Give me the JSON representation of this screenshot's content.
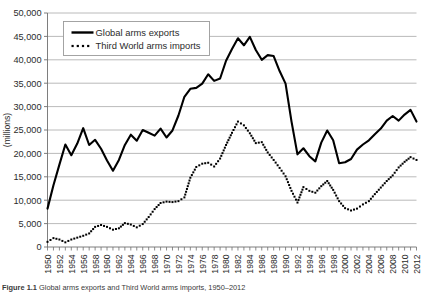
{
  "figure": {
    "caption_label": "Figure 1.1",
    "caption_text": "Global arms exports and Third World arms imports, 1950–2012"
  },
  "axes": {
    "ylabel": "(millions)",
    "yticks": [
      "0",
      "5,000",
      "10,000",
      "15,000",
      "20,000",
      "25,000",
      "30,000",
      "35,000",
      "40,000",
      "45,000",
      "50,000"
    ],
    "xticks": [
      "1950",
      "1952",
      "1954",
      "1956",
      "1958",
      "1960",
      "1962",
      "1964",
      "1966",
      "1968",
      "1970",
      "1972",
      "1974",
      "1976",
      "1978",
      "1980",
      "1982",
      "1984",
      "1986",
      "1988",
      "1990",
      "1992",
      "1994",
      "1996",
      "1998",
      "2000",
      "2002",
      "2004",
      "2006",
      "2008",
      "2010",
      "2012"
    ]
  },
  "legend": {
    "items": [
      {
        "label": "Global arms exports",
        "style": "solid",
        "color": "#000000"
      },
      {
        "label": "Third World arms imports",
        "style": "dotted",
        "color": "#000000"
      }
    ]
  },
  "colors": {
    "line": "#000000",
    "grid": "#a8a8a8",
    "axis": "#8c8c8c",
    "background": "#ffffff"
  },
  "chart_data": {
    "type": "line",
    "title": "",
    "xlabel": "",
    "ylabel": "(millions)",
    "ylim": [
      0,
      50000
    ],
    "xlim": [
      1950,
      2012
    ],
    "grid": true,
    "legend_position": "top-left-inside",
    "x": [
      1950,
      1951,
      1952,
      1953,
      1954,
      1955,
      1956,
      1957,
      1958,
      1959,
      1960,
      1961,
      1962,
      1963,
      1964,
      1965,
      1966,
      1967,
      1968,
      1969,
      1970,
      1971,
      1972,
      1973,
      1974,
      1975,
      1976,
      1977,
      1978,
      1979,
      1980,
      1981,
      1982,
      1983,
      1984,
      1985,
      1986,
      1987,
      1988,
      1989,
      1990,
      1991,
      1992,
      1993,
      1994,
      1995,
      1996,
      1997,
      1998,
      1999,
      2000,
      2001,
      2002,
      2003,
      2004,
      2005,
      2006,
      2007,
      2008,
      2009,
      2010,
      2011,
      2012
    ],
    "series": [
      {
        "name": "Global arms exports",
        "style": "solid",
        "values": [
          8200,
          13200,
          17600,
          21900,
          19600,
          22100,
          25400,
          21800,
          22900,
          21000,
          18500,
          16300,
          18600,
          21800,
          24000,
          22700,
          25000,
          24400,
          23800,
          25300,
          23400,
          24900,
          28100,
          32100,
          33800,
          34000,
          34900,
          36900,
          35500,
          36000,
          39800,
          42300,
          44600,
          43100,
          44900,
          42100,
          40000,
          41000,
          40800,
          37600,
          34900,
          26800,
          19800,
          21100,
          19400,
          18300,
          22300,
          24900,
          22800,
          17900,
          18100,
          18800,
          20800,
          21900,
          22800,
          24100,
          25300,
          27000,
          28000,
          27000,
          28300,
          29300,
          26800
        ]
      },
      {
        "name": "Third World arms imports",
        "style": "dotted",
        "values": [
          1100,
          1900,
          1600,
          1000,
          1600,
          2000,
          2400,
          2900,
          4300,
          4700,
          4300,
          3700,
          4000,
          5100,
          4800,
          4200,
          4900,
          6400,
          8100,
          9400,
          9700,
          9600,
          9800,
          10600,
          14800,
          17100,
          17800,
          18000,
          17200,
          18900,
          21800,
          24400,
          26800,
          26000,
          24300,
          22200,
          22400,
          20200,
          18600,
          16900,
          15100,
          12000,
          9500,
          12800,
          12000,
          11600,
          13000,
          14100,
          12200,
          9800,
          8300,
          7800,
          8200,
          9100,
          9800,
          11300,
          12700,
          14100,
          15300,
          17000,
          18200,
          19200,
          18600
        ]
      }
    ]
  }
}
